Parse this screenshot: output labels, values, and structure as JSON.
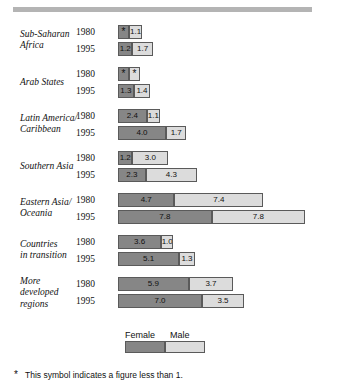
{
  "chart_data": {
    "type": "bar",
    "subtype": "stacked-horizontal",
    "title": "",
    "xlabel": "",
    "ylabel": "",
    "grid": false,
    "legend_position": "bottom",
    "note_symbol": "*",
    "note_text": "This symbol indicates a figure less than 1.",
    "series": [
      {
        "name": "Female",
        "color": "#868686"
      },
      {
        "name": "Male",
        "color": "#dcdcdc"
      }
    ],
    "years": [
      "1980",
      "1995"
    ],
    "categories": [
      "Sub-Saharan Africa",
      "Arab States",
      "Latin America/ Caribbean",
      "Southern Asia",
      "Eastern Asia/ Oceania",
      "Countries in transition",
      "More developed regions"
    ],
    "groups": [
      {
        "label_lines": [
          "Sub-Saharan",
          "Africa"
        ],
        "rows": [
          {
            "year": "1980",
            "female": 0.5,
            "female_label": "*",
            "female_below_one": true,
            "male": 1.1,
            "male_label": "1.1",
            "male_below_one": false
          },
          {
            "year": "1995",
            "female": 1.2,
            "female_label": "1.2",
            "female_below_one": false,
            "male": 1.7,
            "male_label": "1.7",
            "male_below_one": false
          }
        ]
      },
      {
        "label_lines": [
          "Arab States"
        ],
        "rows": [
          {
            "year": "1980",
            "female": 0.5,
            "female_label": "*",
            "female_below_one": true,
            "male": 0.5,
            "male_label": "*",
            "male_below_one": true
          },
          {
            "year": "1995",
            "female": 1.3,
            "female_label": "1.3",
            "female_below_one": false,
            "male": 1.4,
            "male_label": "1.4",
            "male_below_one": false
          }
        ]
      },
      {
        "label_lines": [
          "Latin America/",
          "Caribbean"
        ],
        "rows": [
          {
            "year": "1980",
            "female": 2.4,
            "female_label": "2.4",
            "female_below_one": false,
            "male": 1.1,
            "male_label": "1.1",
            "male_below_one": false
          },
          {
            "year": "1995",
            "female": 4.0,
            "female_label": "4.0",
            "female_below_one": false,
            "male": 1.7,
            "male_label": "1.7",
            "male_below_one": false
          }
        ]
      },
      {
        "label_lines": [
          "Southern Asia"
        ],
        "rows": [
          {
            "year": "1980",
            "female": 1.2,
            "female_label": "1.2",
            "female_below_one": false,
            "male": 3.0,
            "male_label": "3.0",
            "male_below_one": false
          },
          {
            "year": "1995",
            "female": 2.3,
            "female_label": "2.3",
            "female_below_one": false,
            "male": 4.3,
            "male_label": "4.3",
            "male_below_one": false
          }
        ]
      },
      {
        "label_lines": [
          "Eastern Asia/",
          "Oceania"
        ],
        "rows": [
          {
            "year": "1980",
            "female": 4.7,
            "female_label": "4.7",
            "female_below_one": false,
            "male": 7.4,
            "male_label": "7.4",
            "male_below_one": false
          },
          {
            "year": "1995",
            "female": 7.8,
            "female_label": "7.8",
            "female_below_one": false,
            "male": 7.8,
            "male_label": "7.8",
            "male_below_one": false
          }
        ]
      },
      {
        "label_lines": [
          "Countries",
          "in transition"
        ],
        "rows": [
          {
            "year": "1980",
            "female": 3.6,
            "female_label": "3.6",
            "female_below_one": false,
            "male": 1.0,
            "male_label": "1.0",
            "male_below_one": false
          },
          {
            "year": "1995",
            "female": 5.1,
            "female_label": "5.1",
            "female_below_one": false,
            "male": 1.3,
            "male_label": "1.3",
            "male_below_one": false
          }
        ]
      },
      {
        "label_lines": [
          "More",
          "developed",
          "regions"
        ],
        "rows": [
          {
            "year": "1980",
            "female": 5.9,
            "female_label": "5.9",
            "female_below_one": false,
            "male": 3.7,
            "male_label": "3.7",
            "male_below_one": false
          },
          {
            "year": "1995",
            "female": 7.0,
            "female_label": "7.0",
            "female_below_one": false,
            "male": 3.5,
            "male_label": "3.5",
            "male_below_one": false
          }
        ]
      }
    ]
  },
  "legend": {
    "female_label": "Female",
    "male_label": "Male"
  },
  "footnote": {
    "symbol": "*",
    "text": "This symbol indicates a figure less than 1."
  }
}
